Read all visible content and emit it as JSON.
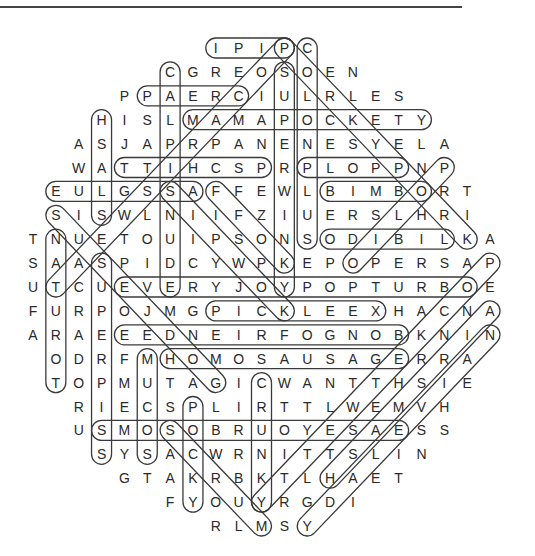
{
  "puzzle": {
    "type": "word-search",
    "grid_origin": {
      "x": 33,
      "y": 48
    },
    "cell_spacing": {
      "x": 22.85,
      "y": 23.9
    },
    "rows": [
      {
        "start_col": 8,
        "letters": "IPIPC"
      },
      {
        "start_col": 6,
        "letters": "CGREOSOEN"
      },
      {
        "start_col": 4,
        "letters": "PPAERCIULRLES"
      },
      {
        "start_col": 3,
        "letters": "HISLMAMAPOCKETY"
      },
      {
        "start_col": 2,
        "letters": "ASJAPRPANENESYELA"
      },
      {
        "start_col": 2,
        "letters": "WATTIHCSPRPLOPPNP"
      },
      {
        "start_col": 1,
        "letters": "EULGSSAFFEWLBIMBORT"
      },
      {
        "start_col": 1,
        "letters": "SISWLNIIFZIUERSLHRI"
      },
      {
        "start_col": 0,
        "letters": "TNUETOUIPSONSODIBILKA"
      },
      {
        "start_col": 0,
        "letters": "SAASPIDCYWPKEPOPERSAP"
      },
      {
        "start_col": 0,
        "letters": "UTCUEVERYJOYPOPTURBOE"
      },
      {
        "start_col": 0,
        "letters": "FURPOJMGPICKLEEXHACNA"
      },
      {
        "start_col": 0,
        "letters": "ARAEEEDNEIRFOGNOBKNIN"
      },
      {
        "start_col": 1,
        "letters": "ODRFMHOMOSAUSAGERRA"
      },
      {
        "start_col": 1,
        "letters": "TOPMUTAGICWANTTHSIE"
      },
      {
        "start_col": 2,
        "letters": "RIECSPLIRTTLWEMVH"
      },
      {
        "start_col": 2,
        "letters": "USMOSOBRUOYESAESS"
      },
      {
        "start_col": 3,
        "letters": "SYSACWRNITTSLIN"
      },
      {
        "start_col": 4,
        "letters": "GTAKRBKTLHAET"
      },
      {
        "start_col": 6,
        "letters": "FYOUYRGDI"
      },
      {
        "start_col": 8,
        "letters": "RLMSY"
      }
    ],
    "found_words": [
      {
        "word": "IPIP",
        "from": [
          0,
          8
        ],
        "to": [
          0,
          11
        ]
      },
      {
        "word": "PAERC",
        "from": [
          2,
          5
        ],
        "to": [
          2,
          9
        ]
      },
      {
        "word": "MAMAPOCKETY",
        "from": [
          3,
          7
        ],
        "to": [
          3,
          17
        ]
      },
      {
        "word": "TTIHCSP",
        "from": [
          5,
          4
        ],
        "to": [
          5,
          10
        ]
      },
      {
        "word": "PLOPP",
        "from": [
          5,
          12
        ],
        "to": [
          5,
          16
        ]
      },
      {
        "word": "EULGSSA",
        "from": [
          6,
          1
        ],
        "to": [
          6,
          7
        ]
      },
      {
        "word": "BIMBO",
        "from": [
          6,
          13
        ],
        "to": [
          6,
          17
        ]
      },
      {
        "word": "ODIBIL",
        "from": [
          8,
          13
        ],
        "to": [
          8,
          18
        ]
      },
      {
        "word": "EVERYJOYPOPTURBO",
        "from": [
          10,
          4
        ],
        "to": [
          10,
          19
        ]
      },
      {
        "word": "PICKLEEX",
        "from": [
          11,
          8
        ],
        "to": [
          11,
          15
        ]
      },
      {
        "word": "EEDNEIRFOGNOB",
        "from": [
          12,
          4
        ],
        "to": [
          12,
          16
        ]
      },
      {
        "word": "HOMOSAUSAGE",
        "from": [
          13,
          6
        ],
        "to": [
          13,
          16
        ]
      },
      {
        "word": "SMOSOBRUOYESAE",
        "from": [
          16,
          3
        ],
        "to": [
          16,
          16
        ]
      },
      {
        "word": "COLONPLUS",
        "from": [
          0,
          12
        ],
        "to": [
          8,
          12
        ]
      },
      {
        "word": "SUPERWINKY",
        "from": [
          1,
          11
        ],
        "to": [
          10,
          11
        ]
      },
      {
        "word": "CALPISNUDE",
        "from": [
          1,
          6
        ],
        "to": [
          10,
          6
        ]
      },
      {
        "word": "HSALS",
        "from": [
          3,
          3
        ],
        "to": [
          7,
          3
        ]
      },
      {
        "word": "NATUROT",
        "from": [
          8,
          1
        ],
        "to": [
          14,
          1
        ]
      },
      {
        "word": "SUPERPISS",
        "from": [
          9,
          3
        ],
        "to": [
          17,
          3
        ]
      },
      {
        "word": "MUCOS",
        "from": [
          13,
          5
        ],
        "to": [
          17,
          5
        ]
      },
      {
        "word": "POCKY",
        "from": [
          15,
          7
        ],
        "to": [
          19,
          7
        ]
      },
      {
        "word": "CRUNKY",
        "from": [
          14,
          10
        ],
        "to": [
          19,
          10
        ]
      },
      {
        "word": "POCARISWEAT",
        "from": [
          0,
          11
        ],
        "to": [
          10,
          1
        ]
      },
      {
        "word": "PORKYPORK",
        "from": [
          0,
          11
        ],
        "to": [
          8,
          19
        ]
      },
      {
        "word": "SUSEJDOG",
        "from": [
          7,
          1
        ],
        "to": [
          14,
          8
        ]
      },
      {
        "word": "SIPWOK",
        "from": [
          6,
          6
        ],
        "to": [
          11,
          11
        ]
      },
      {
        "word": "FFOK",
        "from": [
          6,
          8
        ],
        "to": [
          9,
          11
        ]
      },
      {
        "word": "SCRUM",
        "from": [
          16,
          6
        ],
        "to": [
          20,
          10
        ]
      },
      {
        "word": "POLIO",
        "from": [
          5,
          18
        ],
        "to": [
          9,
          14
        ]
      },
      {
        "word": "POCKETWETTY",
        "from": [
          9,
          20
        ],
        "to": [
          19,
          10
        ]
      },
      {
        "word": "AIRSMASH",
        "from": [
          11,
          20
        ],
        "to": [
          18,
          13
        ]
      },
      {
        "word": "NAIVELADY",
        "from": [
          12,
          20
        ],
        "to": [
          20,
          12
        ]
      }
    ]
  }
}
